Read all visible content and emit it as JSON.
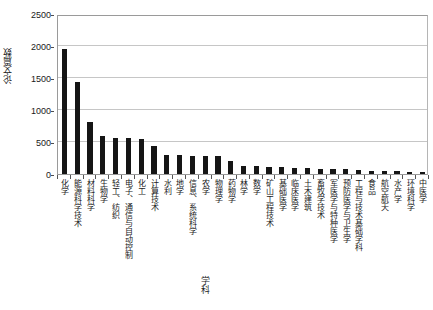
{
  "chart_data": {
    "type": "bar",
    "title": "",
    "subtitle": "",
    "xlabel": "学科",
    "ylabel": "论文篇数",
    "ylim": [
      0,
      2500
    ],
    "ytick_labels": [
      "0",
      "500",
      "1000",
      "1500",
      "2000",
      "2500"
    ],
    "ytick_values": [
      0,
      500,
      1000,
      1500,
      2000,
      2500
    ],
    "grid": true,
    "legend": false,
    "legend_position": "none",
    "bar_color": "#151515",
    "categories": [
      "化学",
      "能源科学技术",
      "材料科学",
      "生物学",
      "轻工、纺织",
      "电子、通信与自动控制",
      "化工",
      "计算技术",
      "水利",
      "地学",
      "信息、系统科学",
      "农学",
      "物理学",
      "药物学",
      "林学",
      "数学",
      "矿山工程技术",
      "基础医学",
      "临床医学",
      "土木建筑",
      "畜牧学技术",
      "军医学与特种医学",
      "预防医学与卫生学",
      "工程与技术基础学科",
      "食品",
      "航空航天",
      "水产学",
      "环境科学",
      "中医学"
    ],
    "values": [
      1960,
      1430,
      820,
      600,
      560,
      555,
      545,
      440,
      300,
      290,
      285,
      280,
      275,
      200,
      130,
      120,
      115,
      110,
      100,
      95,
      85,
      80,
      75,
      70,
      50,
      45,
      40,
      35,
      30
    ]
  }
}
